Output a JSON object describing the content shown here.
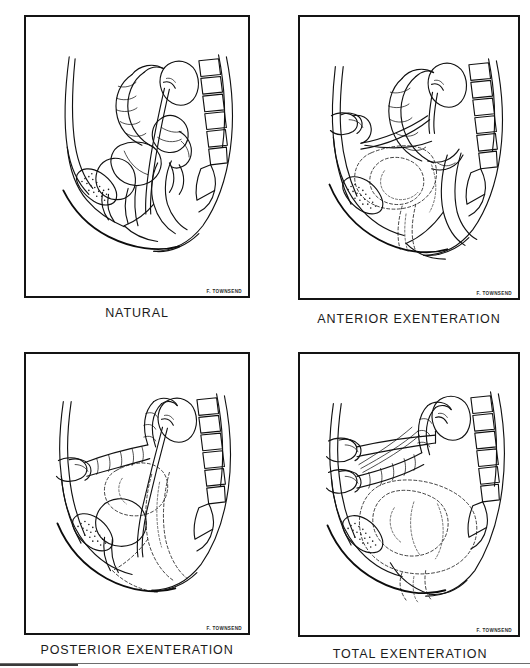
{
  "figure": {
    "kind": "medical-illustration-plate",
    "layout": "2x2 grid of sagittal pelvic line drawings",
    "artist_signature": "F. TOWNSEND",
    "panels": [
      {
        "id": "natural",
        "caption": "NATURAL",
        "row": 0,
        "col": 0,
        "signature": "F. TOWNSEND",
        "structures_drawn": [
          "abdominal wall",
          "pubic symphysis (stippled bone)",
          "urinary bladder",
          "urethra",
          "uterus",
          "vagina",
          "rectum",
          "anal canal",
          "sigmoid colon",
          "small bowel loops",
          "kidney",
          "ureter",
          "lumbar vertebrae",
          "sacrum",
          "coccyx"
        ],
        "resected_shown_dashed": false
      },
      {
        "id": "anterior-exenteration",
        "caption": "ANTERIOR EXENTERATION",
        "row": 0,
        "col": 1,
        "signature": "F. TOWNSEND",
        "structures_drawn": [
          "abdominal wall",
          "pubic symphysis (stippled bone)",
          "ileal conduit / urinary stoma",
          "ureters diverted to stoma",
          "kidney",
          "sigmoid colon",
          "rectum preserved",
          "anal canal",
          "lumbar vertebrae",
          "sacrum"
        ],
        "resected_shown_dashed": true,
        "resected_outline_note": "bladder, uterus and vagina outlined in broken line"
      },
      {
        "id": "posterior-exenteration",
        "caption": "POSTERIOR EXENTERATION",
        "row": 1,
        "col": 0,
        "signature": "F. TOWNSEND",
        "structures_drawn": [
          "abdominal wall",
          "pubic symphysis (stippled bone)",
          "colostomy stoma",
          "descending colon to stoma",
          "bladder preserved",
          "urethra",
          "kidney",
          "ureter",
          "lumbar vertebrae",
          "sacrum"
        ],
        "resected_shown_dashed": true,
        "resected_outline_note": "uterus, vagina and rectum outlined in broken line"
      },
      {
        "id": "total-exenteration",
        "caption": "TOTAL EXENTERATION",
        "row": 1,
        "col": 1,
        "signature": "F. TOWNSEND",
        "structures_drawn": [
          "abdominal wall",
          "pubic symphysis (stippled bone)",
          "colostomy stoma",
          "urinary conduit stoma",
          "kidney",
          "ureters",
          "colon",
          "lumbar vertebrae",
          "sacrum"
        ],
        "resected_shown_dashed": true,
        "resected_outline_note": "bladder, uterus, vagina and rectum all outlined in broken line"
      }
    ]
  },
  "colors": {
    "ink": "#111111",
    "frame": "#141414",
    "paper": "#ffffff",
    "caption": "#1b1b1b",
    "rule": "#6d6d6d"
  }
}
